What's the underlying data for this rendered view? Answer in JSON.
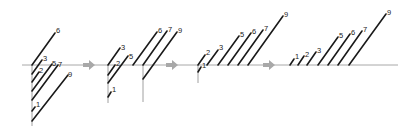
{
  "diagram": {
    "title": "",
    "axis": {
      "y": 65,
      "x1": 22,
      "x2": 398,
      "color": "#a8a8a8"
    },
    "line_color": "#1a1a1a",
    "arrows": [
      {
        "x": 89,
        "y": 65
      },
      {
        "x": 172,
        "y": 65
      },
      {
        "x": 269,
        "y": 65
      }
    ],
    "panels": [
      {
        "name": "panel-1",
        "verticals": [
          {
            "x": 32,
            "y1": 65,
            "y2": 126
          }
        ],
        "segments": [
          {
            "label": "6",
            "x1": 32,
            "y1": 65,
            "x2": 55,
            "y2": 33,
            "lx": 56,
            "ly": 33
          },
          {
            "label": "3",
            "x1": 32,
            "y1": 74,
            "x2": 42,
            "y2": 60,
            "lx": 43,
            "ly": 61
          },
          {
            "label": "2",
            "x1": 32,
            "y1": 82,
            "x2": 39,
            "y2": 72,
            "lx": 39,
            "ly": 73
          },
          {
            "label": "5",
            "x1": 32,
            "y1": 91,
            "x2": 52,
            "y2": 64,
            "lx": 52,
            "ly": 66
          },
          {
            "label": "7",
            "x1": 32,
            "y1": 100,
            "x2": 58,
            "y2": 65,
            "lx": 58,
            "ly": 67
          },
          {
            "label": "1",
            "x1": 32,
            "y1": 111,
            "x2": 35,
            "y2": 107,
            "lx": 36,
            "ly": 107
          },
          {
            "label": "9",
            "x1": 32,
            "y1": 121,
            "x2": 68,
            "y2": 75,
            "lx": 68,
            "ly": 77
          }
        ]
      },
      {
        "name": "panel-2",
        "verticals": [
          {
            "x": 108,
            "y1": 65,
            "y2": 103
          },
          {
            "x": 143,
            "y1": 65,
            "y2": 102
          }
        ],
        "segments": [
          {
            "label": "3",
            "x1": 108,
            "y1": 65,
            "x2": 120,
            "y2": 48,
            "lx": 121,
            "ly": 50
          },
          {
            "label": "2",
            "x1": 108,
            "y1": 75,
            "x2": 115,
            "y2": 65,
            "lx": 116,
            "ly": 66
          },
          {
            "label": "5",
            "x1": 108,
            "y1": 83,
            "x2": 128,
            "y2": 56,
            "lx": 129,
            "ly": 59
          },
          {
            "label": "1",
            "x1": 108,
            "y1": 97,
            "x2": 111,
            "y2": 92,
            "lx": 112,
            "ly": 92
          },
          {
            "label": "6",
            "x1": 133,
            "y1": 65,
            "x2": 157,
            "y2": 32,
            "lx": 158,
            "ly": 33
          },
          {
            "label": "7",
            "x1": 143,
            "y1": 65,
            "x2": 167,
            "y2": 31,
            "lx": 168,
            "ly": 32
          },
          {
            "label": "9",
            "x1": 143,
            "y1": 79,
            "x2": 177,
            "y2": 32,
            "lx": 178,
            "ly": 33
          }
        ]
      },
      {
        "name": "panel-3",
        "verticals": [
          {
            "x": 198,
            "y1": 65,
            "y2": 83
          }
        ],
        "segments": [
          {
            "label": "1",
            "x1": 198,
            "y1": 72,
            "x2": 201,
            "y2": 67,
            "lx": 202,
            "ly": 68
          },
          {
            "label": "2",
            "x1": 198,
            "y1": 65,
            "x2": 205,
            "y2": 55,
            "lx": 206,
            "ly": 55
          },
          {
            "label": "3",
            "x1": 207,
            "y1": 65,
            "x2": 218,
            "y2": 50,
            "lx": 219,
            "ly": 50
          },
          {
            "label": "5",
            "x1": 218,
            "y1": 65,
            "x2": 239,
            "y2": 36,
            "lx": 240,
            "ly": 37
          },
          {
            "label": "6",
            "x1": 228,
            "y1": 65,
            "x2": 251,
            "y2": 33,
            "lx": 252,
            "ly": 34
          },
          {
            "label": "7",
            "x1": 238,
            "y1": 65,
            "x2": 263,
            "y2": 30,
            "lx": 264,
            "ly": 31
          },
          {
            "label": "9",
            "x1": 248,
            "y1": 65,
            "x2": 283,
            "y2": 16,
            "lx": 284,
            "ly": 17
          }
        ]
      },
      {
        "name": "panel-4",
        "verticals": [],
        "segments": [
          {
            "label": "1",
            "x1": 290,
            "y1": 65,
            "x2": 294,
            "y2": 59,
            "lx": 295,
            "ly": 59
          },
          {
            "label": "2",
            "x1": 298,
            "y1": 65,
            "x2": 304,
            "y2": 56,
            "lx": 305,
            "ly": 57
          },
          {
            "label": "3",
            "x1": 307,
            "y1": 65,
            "x2": 316,
            "y2": 52,
            "lx": 317,
            "ly": 53
          },
          {
            "label": "5",
            "x1": 318,
            "y1": 65,
            "x2": 338,
            "y2": 37,
            "lx": 339,
            "ly": 38
          },
          {
            "label": "6",
            "x1": 328,
            "y1": 65,
            "x2": 350,
            "y2": 34,
            "lx": 351,
            "ly": 35
          },
          {
            "label": "7",
            "x1": 338,
            "y1": 65,
            "x2": 362,
            "y2": 31,
            "lx": 363,
            "ly": 32
          },
          {
            "label": "9",
            "x1": 349,
            "y1": 65,
            "x2": 386,
            "y2": 14,
            "lx": 387,
            "ly": 15
          }
        ]
      }
    ]
  }
}
